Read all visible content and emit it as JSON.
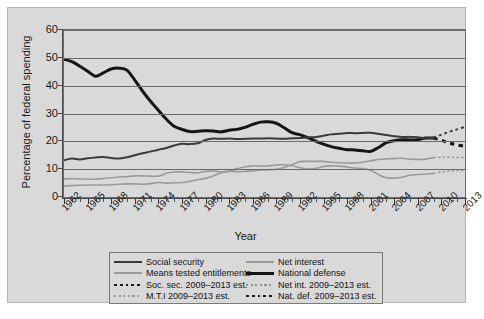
{
  "figure": {
    "background_color": "#d9d9d9",
    "plot_background_color": "#d9d9d9",
    "frame_color": "#6e6e6e"
  },
  "axes": {
    "y_title": "Percentage of federal spending",
    "x_title": "Year",
    "y_ticks": [
      "0",
      "10",
      "20",
      "30",
      "40",
      "50",
      "60"
    ],
    "x_ticks": [
      "1962",
      "1965",
      "1968",
      "1971",
      "1974",
      "1977",
      "1980",
      "1983",
      "1986",
      "1989",
      "1992",
      "1995",
      "1998",
      "2001",
      "2004",
      "2007",
      "2010",
      "2013"
    ]
  },
  "legend": {
    "rows": [
      [
        {
          "label": "Social security",
          "style": "solid",
          "color": "#3a3a3a",
          "width": 2.0,
          "name": "legend-social-security"
        },
        {
          "label": "Net interest",
          "style": "solid",
          "color": "#9a9a9a",
          "width": 1.6,
          "name": "legend-net-interest"
        }
      ],
      [
        {
          "label": "Means tested entitlements",
          "style": "solid",
          "color": "#9a9a9a",
          "width": 1.6,
          "name": "legend-means-tested"
        },
        {
          "label": "National defense",
          "style": "solid",
          "color": "#151515",
          "width": 3.0,
          "name": "legend-national-defense"
        }
      ],
      [
        {
          "label": "Soc. sec. 2009–2013 est.",
          "style": "dashed",
          "color": "#1a1a1a",
          "width": 2.0,
          "name": "legend-soc-sec-est"
        },
        {
          "label": "Net int. 2009–2013 est.",
          "style": "dashed",
          "color": "#8f8f8f",
          "width": 1.6,
          "name": "legend-net-int-est"
        }
      ],
      [
        {
          "label": "M.T.I 2009–2013 est.",
          "style": "dashed",
          "color": "#9a9a9a",
          "width": 1.6,
          "name": "legend-mti-est"
        },
        {
          "label": "Nat. def. 2009–2013 est.",
          "style": "dashed",
          "color": "#1a1a1a",
          "width": 2.0,
          "name": "legend-nat-def-est"
        }
      ]
    ]
  },
  "chart_data": {
    "type": "line",
    "title": "",
    "xlabel": "Year",
    "ylabel": "Percentage of federal spending",
    "xlim": [
      1962,
      2013
    ],
    "ylim": [
      0,
      60
    ],
    "yticks": [
      0,
      10,
      20,
      30,
      40,
      50,
      60
    ],
    "xticks": [
      1962,
      1965,
      1968,
      1971,
      1974,
      1977,
      1980,
      1983,
      1986,
      1989,
      1992,
      1995,
      1998,
      2001,
      2004,
      2007,
      2010,
      2013
    ],
    "grid": "horizontal",
    "legend_position": "below-plot",
    "x": [
      1962,
      1963,
      1964,
      1965,
      1966,
      1967,
      1968,
      1969,
      1970,
      1971,
      1972,
      1973,
      1974,
      1975,
      1976,
      1977,
      1978,
      1979,
      1980,
      1981,
      1982,
      1983,
      1984,
      1985,
      1986,
      1987,
      1988,
      1989,
      1990,
      1991,
      1992,
      1993,
      1994,
      1995,
      1996,
      1997,
      1998,
      1999,
      2000,
      2001,
      2002,
      2003,
      2004,
      2005,
      2006,
      2007,
      2008,
      2009
    ],
    "x_projection": [
      2009,
      2010,
      2011,
      2012,
      2013
    ],
    "series": [
      {
        "name": "National defense",
        "color": "#151515",
        "width": 3.0,
        "style": "solid",
        "values": [
          49.5,
          48.6,
          47.0,
          45.2,
          43.4,
          44.6,
          46.0,
          46.3,
          45.6,
          42.0,
          38.0,
          34.4,
          31.2,
          28.0,
          25.4,
          24.3,
          23.5,
          23.6,
          23.8,
          23.7,
          23.4,
          24.0,
          24.3,
          25.0,
          26.1,
          26.9,
          27.0,
          26.5,
          24.9,
          23.1,
          22.4,
          21.3,
          20.1,
          19.0,
          18.1,
          17.5,
          17.0,
          16.9,
          16.6,
          16.4,
          17.8,
          19.5,
          20.2,
          20.6,
          20.5,
          20.6,
          21.2,
          21.2
        ],
        "projection": [
          21.2,
          20.4,
          19.4,
          18.7,
          18.2
        ]
      },
      {
        "name": "Social security",
        "color": "#3a3a3a",
        "width": 2.0,
        "style": "solid",
        "values": [
          13.2,
          13.8,
          13.5,
          13.9,
          14.2,
          14.4,
          14.0,
          13.8,
          14.3,
          15.0,
          15.7,
          16.3,
          17.0,
          17.6,
          18.5,
          19.1,
          19.0,
          19.3,
          20.5,
          21.0,
          20.9,
          21.0,
          20.8,
          20.9,
          21.0,
          21.0,
          21.1,
          21.0,
          20.9,
          21.1,
          21.2,
          21.4,
          21.5,
          22.0,
          22.5,
          22.7,
          23.0,
          22.9,
          23.0,
          23.1,
          22.7,
          22.3,
          21.8,
          21.6,
          21.6,
          21.5,
          21.1,
          21.3
        ],
        "projection": [
          21.3,
          22.4,
          23.4,
          24.3,
          25.2
        ]
      },
      {
        "name": "Means tested entitlements",
        "color": "#9a9a9a",
        "width": 1.6,
        "style": "solid",
        "values": [
          6.5,
          6.6,
          6.5,
          6.4,
          6.4,
          6.6,
          6.9,
          7.2,
          7.3,
          7.6,
          7.6,
          7.5,
          7.5,
          8.5,
          9.0,
          9.0,
          8.8,
          8.7,
          9.2,
          9.4,
          9.0,
          9.3,
          9.1,
          9.2,
          9.4,
          9.7,
          9.8,
          10.0,
          10.6,
          11.6,
          12.7,
          12.8,
          12.8,
          12.8,
          12.5,
          12.3,
          12.2,
          12.2,
          12.5,
          13.0,
          13.5,
          13.7,
          13.8,
          13.9,
          13.6,
          13.5,
          13.6,
          14.2
        ],
        "projection": [
          14.2,
          14.3,
          14.3,
          14.2,
          14.2
        ]
      },
      {
        "name": "Net interest",
        "color": "#9a9a9a",
        "width": 1.6,
        "style": "solid",
        "values": [
          4.0,
          4.1,
          4.2,
          4.3,
          4.3,
          4.3,
          4.4,
          4.6,
          4.7,
          4.7,
          4.6,
          4.8,
          5.2,
          5.0,
          5.1,
          5.2,
          5.6,
          6.2,
          6.7,
          7.6,
          8.7,
          9.2,
          10.2,
          10.8,
          11.2,
          11.1,
          11.2,
          11.5,
          11.6,
          11.2,
          10.5,
          10.1,
          10.2,
          11.0,
          11.2,
          11.1,
          10.8,
          10.4,
          10.2,
          9.6,
          8.0,
          6.9,
          6.8,
          7.1,
          7.8,
          8.1,
          8.2,
          8.5
        ],
        "projection": [
          8.5,
          9.0,
          9.3,
          9.5,
          9.6
        ]
      }
    ]
  }
}
